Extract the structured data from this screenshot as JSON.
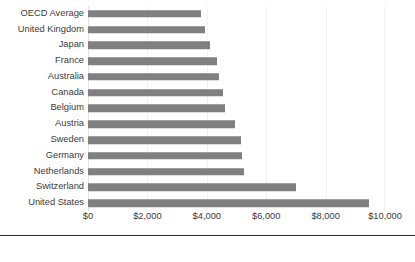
{
  "chart_data": {
    "type": "bar",
    "orientation": "horizontal",
    "title": "",
    "subtitle": "",
    "xlabel": "",
    "ylabel": "",
    "xlim": [
      0,
      10000
    ],
    "grid": true,
    "legend": false,
    "legend_position": "none",
    "bar_color": "#808080",
    "categories": [
      "OECD Average",
      "United Kingdom",
      "Japan",
      "France",
      "Australia",
      "Canada",
      "Belgium",
      "Austria",
      "Sweden",
      "Germany",
      "Netherlands",
      "Switzerland",
      "United States"
    ],
    "values": [
      3800,
      3950,
      4100,
      4350,
      4400,
      4550,
      4600,
      4950,
      5150,
      5200,
      5250,
      7000,
      9450
    ],
    "xticks": [
      0,
      2000,
      4000,
      6000,
      8000,
      10000
    ],
    "xticklabels": [
      "$0",
      "$2,000",
      "$4,000",
      "$6,000",
      "$8,000",
      "$10,000"
    ]
  }
}
